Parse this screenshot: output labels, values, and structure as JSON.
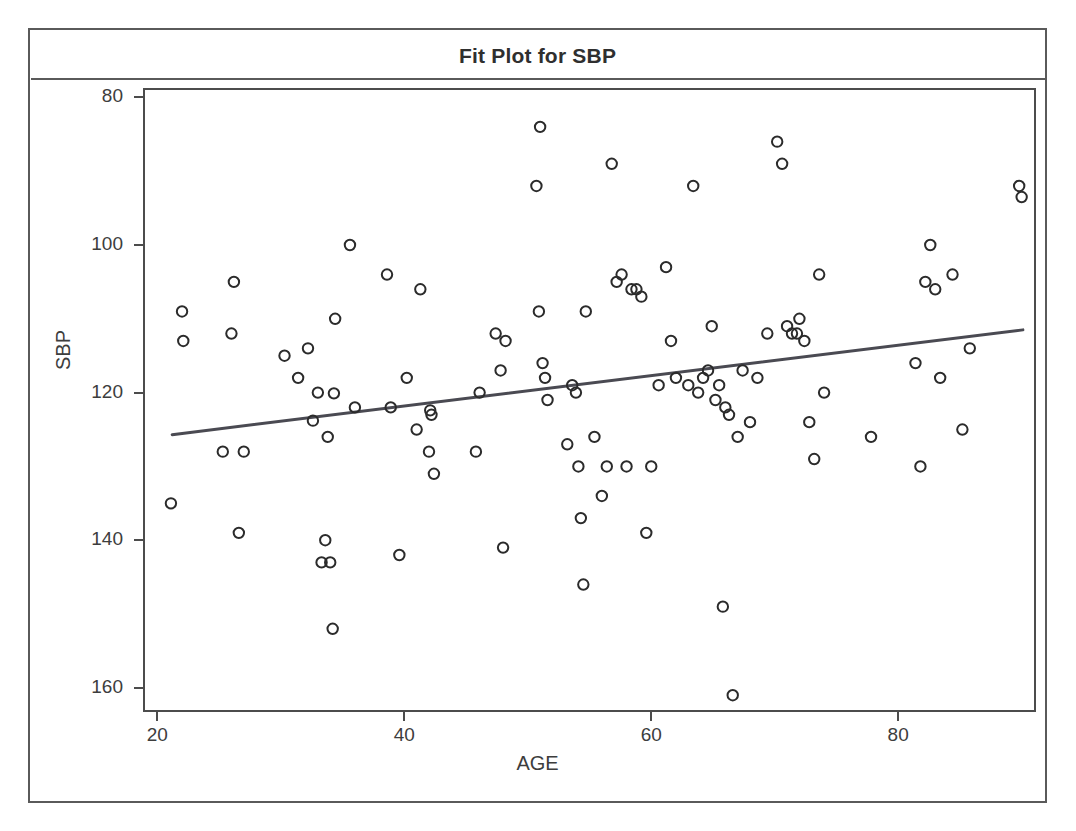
{
  "figure": {
    "title": "Fit Plot for SBP"
  },
  "chart_data": {
    "type": "scatter",
    "title": "Fit Plot for SBP",
    "xlabel": "AGE",
    "ylabel": "SBP",
    "xlim": [
      19,
      91
    ],
    "ylim": [
      77,
      161
    ],
    "xticks": [
      20,
      40,
      60,
      80
    ],
    "yticks": [
      80,
      100,
      120,
      140,
      160
    ],
    "grid": false,
    "legend": false,
    "marker": "open-circle",
    "marker_color": "#2b2b2b",
    "fit_line_color": "#4a4a52",
    "series": [
      {
        "name": "Observations",
        "x": [
          21.1,
          22.0,
          22.1,
          25.3,
          26.0,
          26.2,
          26.6,
          27.0,
          30.3,
          31.4,
          32.2,
          32.6,
          33.0,
          33.3,
          33.6,
          33.8,
          34.0,
          34.2,
          34.3,
          34.4,
          35.6,
          36.0,
          38.6,
          38.9,
          39.6,
          40.2,
          41.0,
          41.3,
          42.0,
          42.1,
          42.2,
          42.4,
          45.8,
          46.1,
          47.4,
          47.8,
          48.0,
          48.2,
          50.7,
          50.9,
          51.0,
          51.2,
          51.4,
          51.6,
          53.2,
          53.6,
          53.9,
          54.1,
          54.3,
          54.5,
          54.7,
          55.4,
          56.0,
          56.4,
          56.8,
          57.2,
          57.6,
          58.0,
          58.4,
          58.8,
          59.2,
          59.6,
          60.0,
          60.6,
          61.2,
          61.6,
          62.0,
          63.0,
          63.4,
          63.8,
          64.2,
          64.6,
          64.9,
          65.2,
          65.5,
          65.8,
          66.0,
          66.3,
          66.6,
          67.0,
          67.4,
          68.0,
          68.6,
          69.4,
          70.2,
          70.6,
          71.0,
          71.4,
          71.8,
          72.0,
          72.4,
          72.8,
          73.2,
          73.6,
          74.0,
          77.8,
          81.4,
          81.8,
          82.2,
          82.6,
          83.0,
          83.4,
          84.4,
          85.2,
          85.8,
          89.8,
          90.0
        ],
        "y": [
          105.0,
          131.0,
          127.0,
          112.0,
          128.0,
          135.0,
          101.0,
          112.0,
          125.0,
          122.0,
          126.0,
          116.2,
          120.0,
          97.0,
          100.0,
          114.0,
          97.0,
          88.0,
          119.9,
          130.0,
          140.0,
          118.0,
          136.0,
          118.0,
          98.0,
          122.0,
          115.0,
          134.0,
          112.0,
          117.6,
          117.0,
          109.0,
          112.0,
          120.0,
          128.0,
          123.0,
          99.0,
          127.0,
          148.0,
          131.0,
          156.0,
          124.0,
          122.0,
          119.0,
          113.0,
          121.0,
          120.0,
          110.0,
          103.0,
          94.0,
          131.0,
          114.0,
          106.0,
          110.0,
          151.0,
          135.0,
          136.0,
          110.0,
          134.0,
          134.0,
          133.0,
          101.0,
          110.0,
          121.0,
          137.0,
          127.0,
          122.0,
          121.0,
          148.0,
          120.0,
          122.0,
          123.0,
          129.0,
          119.0,
          121.0,
          91.0,
          118.0,
          117.0,
          79.0,
          114.0,
          123.0,
          116.0,
          122.0,
          128.0,
          154.0,
          151.0,
          129.0,
          128.0,
          128.0,
          130.0,
          127.0,
          116.0,
          111.0,
          136.0,
          120.0,
          114.0,
          124.0,
          110.0,
          135.0,
          140.0,
          134.0,
          122.0,
          136.0,
          115.0,
          126.0,
          148.0,
          146.5
        ]
      }
    ],
    "fit_line": {
      "name": "Linear fit",
      "x": [
        21.2,
        90.1
      ],
      "y": [
        114.3,
        128.5
      ]
    }
  },
  "axes": {
    "y": {
      "label": "SBP",
      "ticks": [
        "160",
        "140",
        "120",
        "100",
        "80"
      ],
      "tick_values": [
        160,
        140,
        120,
        100,
        80
      ]
    },
    "x": {
      "label": "AGE",
      "ticks": [
        "20",
        "40",
        "60",
        "80"
      ],
      "tick_values": [
        20,
        40,
        60,
        80
      ]
    }
  }
}
